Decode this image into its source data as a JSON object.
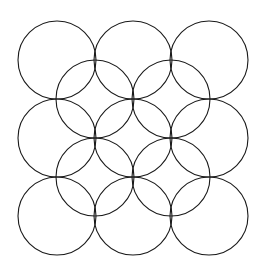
{
  "figure": {
    "canvas": {
      "width": 262,
      "height": 275
    },
    "background_color": "#ffffff",
    "stroke_color": "#1a1a1a",
    "stroke_width": 1.1,
    "fill": "none"
  },
  "chart_data": {
    "type": "scatter",
    "xlabel": "",
    "ylabel": "",
    "xlim": [
      0,
      262
    ],
    "ylim": [
      0,
      275
    ],
    "grid": false,
    "legend": null,
    "shape": "circle",
    "radius": 39,
    "grids": [
      {
        "name": "primary-grid",
        "rows": 3,
        "cols": 3,
        "x_centers": [
          57,
          133,
          209
        ],
        "y_centers": [
          60,
          138,
          216
        ],
        "radius": 39
      },
      {
        "name": "offset-grid",
        "rows": 2,
        "cols": 2,
        "x_centers": [
          95,
          171
        ],
        "y_centers": [
          99,
          177
        ],
        "radius": 39
      }
    ],
    "circles": [
      {
        "id": "c-r0-c0",
        "cx": 57,
        "cy": 60,
        "r": 39,
        "grid": "primary"
      },
      {
        "id": "c-r0-c1",
        "cx": 133,
        "cy": 60,
        "r": 39,
        "grid": "primary"
      },
      {
        "id": "c-r0-c2",
        "cx": 209,
        "cy": 60,
        "r": 39,
        "grid": "primary"
      },
      {
        "id": "c-r1-c0",
        "cx": 57,
        "cy": 138,
        "r": 39,
        "grid": "primary"
      },
      {
        "id": "c-r1-c1",
        "cx": 133,
        "cy": 138,
        "r": 39,
        "grid": "primary"
      },
      {
        "id": "c-r1-c2",
        "cx": 209,
        "cy": 138,
        "r": 39,
        "grid": "primary"
      },
      {
        "id": "c-r2-c0",
        "cx": 57,
        "cy": 216,
        "r": 39,
        "grid": "primary"
      },
      {
        "id": "c-r2-c1",
        "cx": 133,
        "cy": 216,
        "r": 39,
        "grid": "primary"
      },
      {
        "id": "c-r2-c2",
        "cx": 209,
        "cy": 216,
        "r": 39,
        "grid": "primary"
      },
      {
        "id": "c-o0-c0",
        "cx": 95,
        "cy": 99,
        "r": 39,
        "grid": "offset"
      },
      {
        "id": "c-o0-c1",
        "cx": 171,
        "cy": 99,
        "r": 39,
        "grid": "offset"
      },
      {
        "id": "c-o1-c0",
        "cx": 95,
        "cy": 177,
        "r": 39,
        "grid": "offset"
      },
      {
        "id": "c-o1-c1",
        "cx": 171,
        "cy": 177,
        "r": 39,
        "grid": "offset"
      }
    ],
    "nodes": [
      {
        "x": 55,
        "y": 99
      },
      {
        "x": 131,
        "y": 99
      },
      {
        "x": 207,
        "y": 99
      },
      {
        "x": 56,
        "y": 177
      },
      {
        "x": 132,
        "y": 177
      },
      {
        "x": 208,
        "y": 177
      }
    ],
    "bounds": {
      "left": 18,
      "top": 21,
      "right": 247,
      "bottom": 256
    }
  }
}
